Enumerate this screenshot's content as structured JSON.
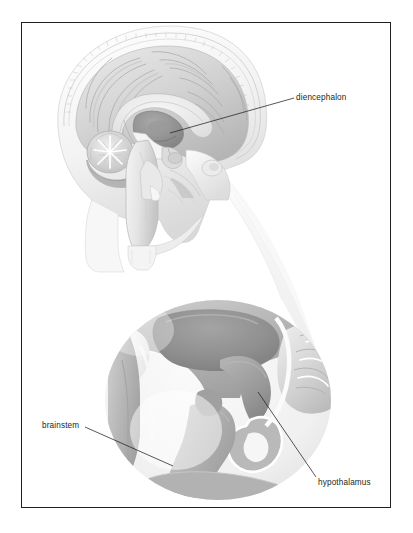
{
  "figure": {
    "background_color": "#ffffff",
    "frame_color": "#231f20",
    "style": "grayscale medical illustration"
  },
  "panels": {
    "upper": {
      "name": "midsagittal-head-section",
      "description": "Midsagittal section of the human head showing skull, cerebrum, corpus callosum, cerebellum and brainstem"
    },
    "lower": {
      "name": "magnified-diencephalon-inset",
      "description": "Circular magnified view of the diencephalon region showing thalamus, hypothalamus, pituitary and brainstem"
    }
  },
  "labels": [
    {
      "id": "diencephalon",
      "text": "diencephalon",
      "leader_from_x": 294,
      "leader_from_y": 98,
      "leader_to_x": 170,
      "leader_to_y": 133
    },
    {
      "id": "brainstem",
      "text": "brainstem",
      "leader_from_x": 85,
      "leader_from_y": 427,
      "leader_to_x": 173,
      "leader_to_y": 466
    },
    {
      "id": "hypothalamus",
      "text": "hypothalamus",
      "leader_from_x": 316,
      "leader_from_y": 477,
      "leader_to_x": 258,
      "leader_to_y": 392
    }
  ],
  "colors": {
    "ink": "#231f20",
    "gray_dark": "#8d8d8d",
    "gray_mid": "#a8a8a8",
    "gray_light": "#c9c9c9",
    "gray_pale": "#e3e3e3",
    "gray_faint": "#f2f2f2",
    "white": "#ffffff"
  }
}
